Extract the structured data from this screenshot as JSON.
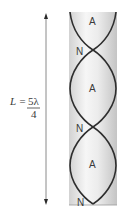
{
  "diagram": {
    "length_label": {
      "lhs": "L =",
      "numerator": "5λ",
      "denominator": "4"
    },
    "node_label": "N",
    "antinode_label": "A",
    "labels_top_to_bottom": [
      "A",
      "N",
      "A",
      "N",
      "A",
      "N"
    ],
    "colors": {
      "wave": "#2e2e2e",
      "tube_light": "#f4f4f4",
      "tube_dark": "#c9c9c9",
      "arrow": "#555555",
      "text": "#3a3a3a"
    }
  }
}
